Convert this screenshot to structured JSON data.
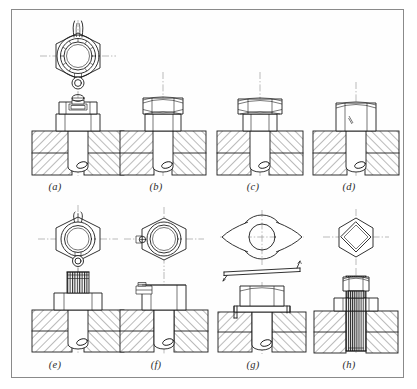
{
  "figure": {
    "type": "engineering-drawing",
    "border_color": "#8a8a8a",
    "line_color": "#1c1c1c",
    "centerline_color": "#8d8d8d",
    "background": "#fefefe",
    "rows": 2,
    "columns": 4
  },
  "labels": [
    {
      "id": "a",
      "text": "(a)",
      "x": 43,
      "y": 174,
      "description": "castellated (castle) nut with split pin, top view and sectional front view"
    },
    {
      "id": "b",
      "text": "(b)",
      "x": 144,
      "y": 174,
      "description": "lock nut (two full nuts tightened together)"
    },
    {
      "id": "c",
      "text": "(c)",
      "x": 240,
      "y": 174,
      "description": "thin check nut above standard nut"
    },
    {
      "id": "d",
      "text": "(d)",
      "x": 337,
      "y": 174,
      "description": "nut locked by grub screw through flank"
    },
    {
      "id": "e",
      "text": "(e)",
      "x": 43,
      "y": 352,
      "description": "split pin through bolt above nut, top view and sectional front view"
    },
    {
      "id": "f",
      "text": "(f)",
      "x": 144,
      "y": 352,
      "description": "nut locked by set screw entering side of nut"
    },
    {
      "id": "g",
      "text": "(g)",
      "x": 240,
      "y": 352,
      "description": "tab washer with bent locking tabs, plan, edge view and assembly"
    },
    {
      "id": "h",
      "text": "(h)",
      "x": 337,
      "y": 352,
      "description": "stud with square collar nut, plan and sectional elevation"
    }
  ],
  "views": {
    "section_hatching": "45 degree cross hatch in opposing directions",
    "thread_shading": "fine vertical thread lines on exposed stud and bolt ends",
    "centerlines": "long-dash dot-dash vertical and horizontal axes"
  }
}
